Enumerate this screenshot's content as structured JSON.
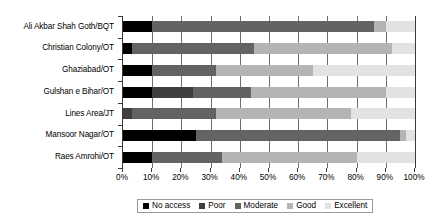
{
  "chart_data": {
    "type": "bar",
    "subtype": "stacked-horizontal-100",
    "title": "",
    "xlabel": "",
    "ylabel": "",
    "xlim": [
      0,
      100
    ],
    "grid": true,
    "legend_position": "bottom",
    "categories": [
      "Ali Akbar Shah Goth/BQT",
      "Christian Colony/OT",
      "Ghaziabad/OT",
      "Gulshan e Bihar/OT",
      "Lines Area/JT",
      "Mansoor Nagar/OT",
      "Raes Amrohi/OT"
    ],
    "xticks": [
      "0%",
      "10%",
      "20%",
      "30%",
      "40%",
      "50%",
      "60%",
      "70%",
      "80%",
      "90%",
      "100%"
    ],
    "xtick_values": [
      0,
      10,
      20,
      30,
      40,
      50,
      60,
      70,
      80,
      90,
      100
    ],
    "series": [
      {
        "name": "No access",
        "color": "#000000",
        "values": [
          10,
          3,
          10,
          10,
          0,
          25,
          10
        ]
      },
      {
        "name": "Poor",
        "color": "#3f3f3f",
        "values": [
          0,
          0,
          0,
          14,
          3,
          0,
          0
        ]
      },
      {
        "name": "Moderate",
        "color": "#636363",
        "values": [
          76,
          42,
          22,
          20,
          29,
          70,
          24
        ]
      },
      {
        "name": "Good",
        "color": "#b4b4b4",
        "values": [
          4,
          47,
          33,
          46,
          46,
          2,
          46
        ]
      },
      {
        "name": "Excellent",
        "color": "#e2e2e2",
        "values": [
          10,
          8,
          35,
          10,
          22,
          3,
          20
        ]
      }
    ]
  },
  "legend": {
    "items": [
      {
        "label": "No access",
        "color": "#000000"
      },
      {
        "label": "Poor",
        "color": "#3f3f3f"
      },
      {
        "label": "Moderate",
        "color": "#636363"
      },
      {
        "label": "Good",
        "color": "#b4b4b4"
      },
      {
        "label": "Excellent",
        "color": "#e2e2e2"
      }
    ]
  }
}
